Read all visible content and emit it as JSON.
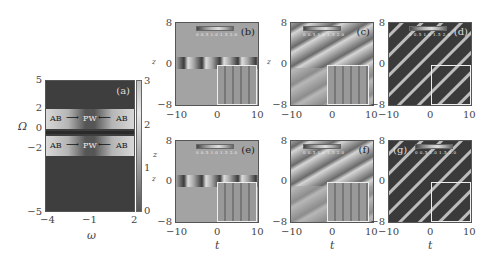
{
  "figure": {
    "panel_a": {
      "label": "(a)",
      "xlabel": "ω",
      "ylabel": "Ω",
      "xticks": [
        "−4",
        "−1",
        "2"
      ],
      "yticks": [
        "5",
        "2",
        "0",
        "−2",
        "−5"
      ],
      "xlim": [
        -4,
        2
      ],
      "ylim": [
        -5,
        5
      ],
      "annotations": [
        {
          "text": "AB",
          "side": "left-upper"
        },
        {
          "text": "PW",
          "side": "center-upper"
        },
        {
          "text": "AB",
          "side": "right-upper"
        },
        {
          "text": "AB",
          "side": "left-lower"
        },
        {
          "text": "PW",
          "side": "center-lower"
        },
        {
          "text": "AB",
          "side": "right-lower"
        }
      ],
      "colorbar": {
        "ticks": [
          "3",
          "2",
          "1",
          "0"
        ],
        "label": "z",
        "range": [
          0,
          3
        ]
      }
    },
    "panels": [
      {
        "label": "(b)",
        "row": 1,
        "col": 1,
        "pattern": "localized-row",
        "label_pos": "right"
      },
      {
        "label": "(c)",
        "row": 1,
        "col": 2,
        "pattern": "diagonal-stripes-upper",
        "label_pos": "right"
      },
      {
        "label": "(d)",
        "row": 1,
        "col": 3,
        "pattern": "dense-diagonal-stripes",
        "label_pos": "right"
      },
      {
        "label": "(e)",
        "row": 2,
        "col": 1,
        "pattern": "localized-row",
        "label_pos": "right"
      },
      {
        "label": "(f)",
        "row": 2,
        "col": 2,
        "pattern": "diagonal-stripes-upper",
        "label_pos": "right"
      },
      {
        "label": "(g)",
        "row": 2,
        "col": 3,
        "pattern": "dense-diagonal-stripes",
        "label_pos": "left"
      }
    ],
    "grid_axes": {
      "xlabel": "t",
      "ylabel": "z",
      "xticks": [
        "−10",
        "0",
        "10"
      ],
      "yticks": [
        "8",
        "0",
        "−8"
      ],
      "xlim": [
        -10,
        10
      ],
      "ylim": [
        -8,
        8
      ]
    },
    "mini_colorbar_ticks": "0 0.5 1.0 1.5 2.0"
  }
}
